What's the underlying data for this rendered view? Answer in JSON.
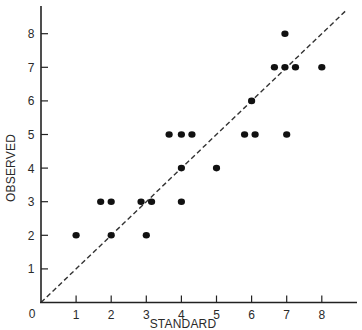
{
  "chart_data": {
    "type": "scatter",
    "title": "",
    "xlabel": "STANDARD",
    "ylabel": "OBSERVED",
    "xlim": [
      0,
      9
    ],
    "ylim": [
      0,
      8.8
    ],
    "x_ticks": [
      0,
      1,
      2,
      3,
      4,
      5,
      6,
      7,
      8
    ],
    "y_ticks": [
      1,
      2,
      3,
      4,
      5,
      6,
      7,
      8
    ],
    "origin_label": "0",
    "grid": false,
    "legend": null,
    "reference_line": {
      "style": "dashed",
      "description": "y = x identity line",
      "from": [
        0,
        0
      ],
      "to": [
        8.7,
        8.7
      ]
    },
    "series": [
      {
        "name": "observations",
        "points": [
          {
            "x": 1.0,
            "y": 2
          },
          {
            "x": 2.0,
            "y": 2
          },
          {
            "x": 3.0,
            "y": 2
          },
          {
            "x": 1.7,
            "y": 3
          },
          {
            "x": 2.0,
            "y": 3
          },
          {
            "x": 2.85,
            "y": 3
          },
          {
            "x": 3.15,
            "y": 3
          },
          {
            "x": 4.0,
            "y": 3
          },
          {
            "x": 4.0,
            "y": 4
          },
          {
            "x": 5.0,
            "y": 4
          },
          {
            "x": 3.65,
            "y": 5
          },
          {
            "x": 4.0,
            "y": 5
          },
          {
            "x": 4.3,
            "y": 5
          },
          {
            "x": 5.8,
            "y": 5
          },
          {
            "x": 6.1,
            "y": 5
          },
          {
            "x": 7.0,
            "y": 5
          },
          {
            "x": 6.0,
            "y": 6
          },
          {
            "x": 6.65,
            "y": 7
          },
          {
            "x": 6.95,
            "y": 7
          },
          {
            "x": 7.25,
            "y": 7
          },
          {
            "x": 8.0,
            "y": 7
          },
          {
            "x": 6.95,
            "y": 8
          }
        ]
      }
    ]
  },
  "colors": {
    "background": "#ffffff",
    "axis": "#222222",
    "points": "#111111",
    "reference_line": "#333333"
  }
}
